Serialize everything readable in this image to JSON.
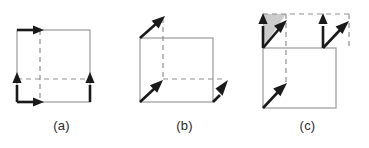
{
  "figure": {
    "background_color": "#ffffff",
    "cube_edge_color": "#9a9a9a",
    "dashed_edge_color": "#8f8f8f",
    "arrow_color": "#1a1a1a",
    "shade_color": "#cccccc",
    "caption_color": "#2b2b2b"
  },
  "panels": [
    {
      "id": "a",
      "caption": "(a)",
      "description": "Cube outline with four bold axis-aligned arrows along the edges",
      "arrow_count": 4,
      "arrow_style": "axis-aligned",
      "has_shaded_region": false,
      "arrows": [
        {
          "name": "top-edge-right-arrow",
          "direction": "right"
        },
        {
          "name": "left-edge-up-arrow",
          "direction": "up"
        },
        {
          "name": "bottom-edge-right-arrow",
          "direction": "right"
        },
        {
          "name": "right-edge-up-arrow",
          "direction": "up"
        }
      ]
    },
    {
      "id": "b",
      "caption": "(b)",
      "description": "Cube outline with three bold diagonal arrows pointing up and to the right",
      "arrow_count": 3,
      "arrow_style": "diagonal",
      "has_shaded_region": false,
      "arrows": [
        {
          "name": "top-left-diagonal-arrow",
          "direction": "up-right"
        },
        {
          "name": "bottom-left-diagonal-arrow",
          "direction": "up-right"
        },
        {
          "name": "bottom-right-diagonal-arrow",
          "direction": "up-right"
        }
      ]
    },
    {
      "id": "c",
      "caption": "(c)",
      "description": "Cube outline with dashed top face, two vertical and three diagonal arrows, and a shaded triangle at the upper left",
      "arrow_count": 5,
      "arrow_style": "mixed",
      "has_shaded_region": true,
      "arrows": [
        {
          "name": "top-left-vertical-arrow",
          "direction": "up"
        },
        {
          "name": "top-left-diagonal-arrow",
          "direction": "up-right"
        },
        {
          "name": "top-right-vertical-arrow",
          "direction": "up"
        },
        {
          "name": "top-right-diagonal-arrow",
          "direction": "up-right"
        },
        {
          "name": "bottom-left-diagonal-arrow",
          "direction": "up-right"
        }
      ]
    }
  ]
}
